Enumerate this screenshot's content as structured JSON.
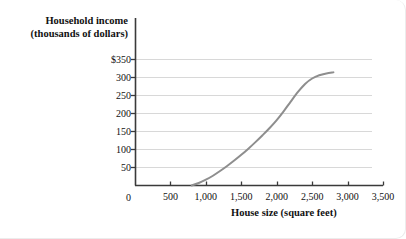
{
  "chart_data": {
    "type": "line",
    "title": "",
    "xlabel": "House size (square feet)",
    "ylabel_lines": [
      "Household income",
      "(thousands of dollars)"
    ],
    "xlim": [
      0,
      3500
    ],
    "ylim": [
      0,
      350
    ],
    "grid": true,
    "legend": "none",
    "xticks": [
      {
        "value": 0,
        "label": "0"
      },
      {
        "value": 500,
        "label": "500"
      },
      {
        "value": 1000,
        "label": "1,000"
      },
      {
        "value": 1500,
        "label": "1,500"
      },
      {
        "value": 2000,
        "label": "2,000"
      },
      {
        "value": 2500,
        "label": "2,500"
      },
      {
        "value": 3000,
        "label": "3,000"
      },
      {
        "value": 3500,
        "label": "3,500"
      }
    ],
    "yticks": [
      {
        "value": 350,
        "label": "$350"
      },
      {
        "value": 300,
        "label": "300"
      },
      {
        "value": 250,
        "label": "250"
      },
      {
        "value": 200,
        "label": "200"
      },
      {
        "value": 150,
        "label": "150"
      },
      {
        "value": 100,
        "label": "100"
      },
      {
        "value": 50,
        "label": "50"
      },
      {
        "value": 0,
        "label": "0"
      }
    ],
    "series": [
      {
        "name": "Household income vs house size",
        "color": "#8e8e8e",
        "x": [
          800,
          900,
          1000,
          1100,
          1200,
          1300,
          1400,
          1500,
          1600,
          1700,
          1800,
          1900,
          2000,
          2100,
          2200,
          2300,
          2400,
          2500,
          2600,
          2700,
          2800
        ],
        "y": [
          0,
          7,
          16,
          27,
          40,
          54,
          69,
          85,
          102,
          120,
          139,
          159,
          181,
          206,
          233,
          259,
          281,
          296,
          305,
          310,
          313
        ]
      }
    ]
  }
}
